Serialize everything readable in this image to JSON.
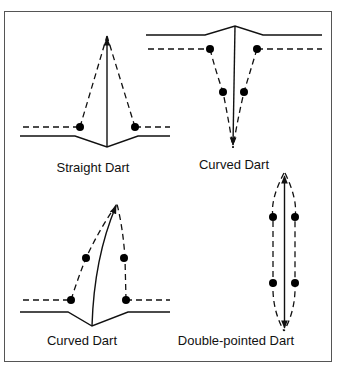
{
  "figure": {
    "frame": {
      "x": 4.5,
      "y": 11.5,
      "width": 327,
      "height": 350
    },
    "colors": {
      "ink": "#111111",
      "frame": "#555555",
      "background": "#ffffff"
    },
    "panels": [
      {
        "id": "straight-dart",
        "label": "Straight Dart",
        "orientation": "apex-up",
        "style": "straight legs"
      },
      {
        "id": "curved-dart-top",
        "label": "Curved Dart",
        "orientation": "apex-down",
        "style": "curved legs with two dot pairs"
      },
      {
        "id": "curved-dart-bottom",
        "label": "Curved Dart",
        "orientation": "apex-up",
        "style": "curved fold line, asymmetric legs"
      },
      {
        "id": "double-pointed-dart",
        "label": "Double-pointed Dart",
        "orientation": "vertical",
        "style": "fish-eye dart with two dot pairs"
      }
    ]
  }
}
